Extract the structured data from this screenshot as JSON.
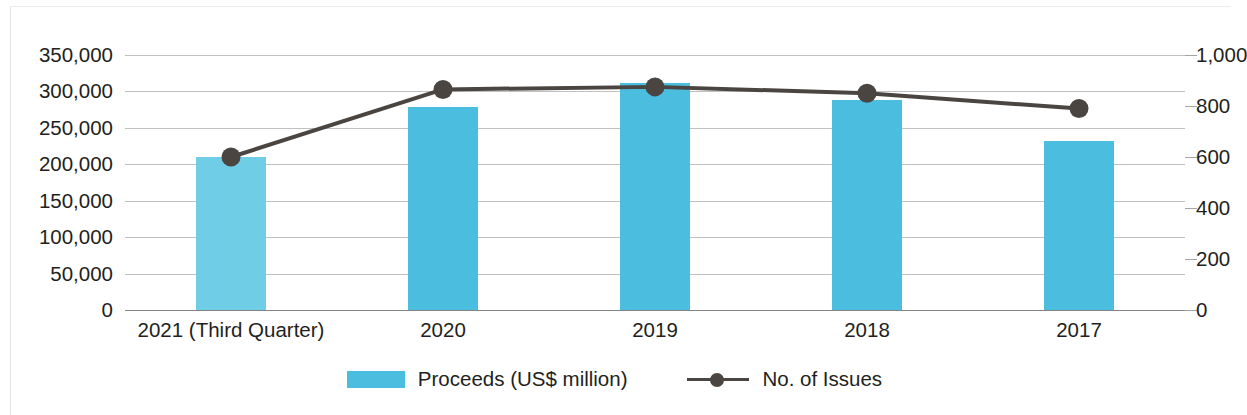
{
  "chart_data": {
    "type": "bar",
    "title": "",
    "subtitle": "",
    "xlabel": "",
    "ylabel": "",
    "grid": true,
    "legend_position": "bottom",
    "categories": [
      "2021 (Third Quarter)",
      "2020",
      "2019",
      "2018",
      "2017"
    ],
    "series": [
      {
        "name": "Proceeds (US$ million)",
        "type": "bar",
        "axis": "left",
        "color": "#4bbee0",
        "values": [
          210000,
          279000,
          311000,
          288000,
          232000
        ]
      },
      {
        "name": "No. of Issues",
        "type": "line",
        "axis": "right",
        "color": "#4a4540",
        "values": [
          600,
          865,
          875,
          850,
          790
        ]
      }
    ],
    "left_axis": {
      "label": "",
      "ylim": [
        0,
        350000
      ],
      "tick_values": [
        350000,
        300000,
        250000,
        200000,
        150000,
        100000,
        50000,
        0
      ],
      "tick_labels": [
        "350,000",
        "300,000",
        "250,000",
        "200,000",
        "150,000",
        "100,000",
        "50,000",
        "0"
      ]
    },
    "right_axis": {
      "label": "",
      "ylim": [
        0,
        1000
      ],
      "tick_values": [
        1000,
        800,
        600,
        400,
        200,
        0
      ],
      "tick_labels": [
        "1,000",
        "800",
        "600",
        "400",
        "200",
        "0"
      ],
      "note": "right axis tick labels are clipped by the right edge of the image"
    }
  },
  "legend": {
    "items": [
      {
        "label": "Proceeds (US$ million)",
        "marker": "bar-swatch-icon",
        "color": "#4bbee0"
      },
      {
        "label": "No. of Issues",
        "marker": "line-marker-icon",
        "color": "#4a4540"
      }
    ]
  },
  "colors": {
    "bar": "#4bbee0",
    "bar_first": "#6fcde6",
    "line": "#4a4540",
    "grid": "#9a9a9a",
    "text": "#231f20",
    "background": "#ffffff"
  }
}
